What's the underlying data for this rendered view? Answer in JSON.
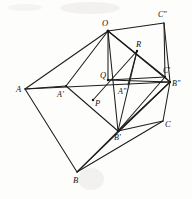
{
  "figure": {
    "width": 192,
    "height": 199,
    "background_color": "#fdfdfc",
    "stroke_color": "#1c1c1c"
  },
  "points": [
    {
      "id": "A",
      "label": "A",
      "x": 25,
      "y": 89,
      "label_x": 16,
      "label_y": 85
    },
    {
      "id": "Aprime",
      "label": "A'",
      "x": 66,
      "y": 86,
      "label_x": 57,
      "label_y": 91
    },
    {
      "id": "Adbl",
      "label": "A\"",
      "x": 128,
      "y": 85,
      "label_x": 118,
      "label_y": 88
    },
    {
      "id": "O",
      "label": "O",
      "x": 108,
      "y": 31,
      "label_x": 102,
      "label_y": 19
    },
    {
      "id": "Q",
      "label": "Q",
      "x": 108,
      "y": 80,
      "label_x": 100,
      "label_y": 71
    },
    {
      "id": "P",
      "label": "P",
      "x": 93,
      "y": 100,
      "label_x": 95,
      "label_y": 99
    },
    {
      "id": "R",
      "label": "R",
      "x": 137,
      "y": 51,
      "label_x": 136,
      "label_y": 40
    },
    {
      "id": "B",
      "label": "B",
      "x": 77,
      "y": 172,
      "label_x": 73,
      "label_y": 176
    },
    {
      "id": "Bprime",
      "label": "B'",
      "x": 118,
      "y": 131,
      "label_x": 114,
      "label_y": 134
    },
    {
      "id": "Bdbl",
      "label": "B\"",
      "x": 170,
      "y": 82,
      "label_x": 172,
      "label_y": 80
    },
    {
      "id": "C",
      "label": "C",
      "x": 163,
      "y": 121,
      "label_x": 165,
      "label_y": 120
    },
    {
      "id": "Cprime",
      "label": "C'",
      "x": 165,
      "y": 77,
      "label_x": 163,
      "label_y": 67
    },
    {
      "id": "Cdbl",
      "label": "C\"",
      "x": 164,
      "y": 23,
      "label_x": 158,
      "label_y": 11
    }
  ],
  "segments": [
    {
      "name": "A-O",
      "x1": 25,
      "y1": 89,
      "x2": 108,
      "y2": 31
    },
    {
      "name": "A-Aprime",
      "x1": 25,
      "y1": 89,
      "x2": 66,
      "y2": 86
    },
    {
      "name": "A-Bdbl",
      "x1": 25,
      "y1": 89,
      "x2": 170,
      "y2": 82
    },
    {
      "name": "A-B",
      "x1": 25,
      "y1": 89,
      "x2": 77,
      "y2": 172
    },
    {
      "name": "Aprime-O",
      "x1": 66,
      "y1": 86,
      "x2": 108,
      "y2": 31
    },
    {
      "name": "Aprime-Bprime",
      "x1": 66,
      "y1": 86,
      "x2": 118,
      "y2": 131
    },
    {
      "name": "O-Q",
      "x1": 108,
      "y1": 31,
      "x2": 108,
      "y2": 80
    },
    {
      "name": "O-Cdbl",
      "x1": 108,
      "y1": 31,
      "x2": 164,
      "y2": 23
    },
    {
      "name": "O-Cprime",
      "x1": 108,
      "y1": 31,
      "x2": 165,
      "y2": 77
    },
    {
      "name": "O-Bdbl",
      "x1": 108,
      "y1": 31,
      "x2": 170,
      "y2": 82
    },
    {
      "name": "O-Bprime",
      "x1": 108,
      "y1": 31,
      "x2": 118,
      "y2": 131
    },
    {
      "name": "Q-Bdbl",
      "x1": 108,
      "y1": 80,
      "x2": 170,
      "y2": 82
    },
    {
      "name": "Q-Cprime",
      "x1": 108,
      "y1": 80,
      "x2": 165,
      "y2": 77
    },
    {
      "name": "Cdbl-Cprime",
      "x1": 164,
      "y1": 23,
      "x2": 165,
      "y2": 77
    },
    {
      "name": "Cdbl-Bdbl",
      "x1": 164,
      "y1": 23,
      "x2": 170,
      "y2": 82
    },
    {
      "name": "Cprime-Bdbl",
      "x1": 165,
      "y1": 77,
      "x2": 170,
      "y2": 82
    },
    {
      "name": "Bdbl-C",
      "x1": 170,
      "y1": 82,
      "x2": 163,
      "y2": 121
    },
    {
      "name": "Bdbl-Bprime",
      "x1": 170,
      "y1": 82,
      "x2": 118,
      "y2": 131
    },
    {
      "name": "Cprime-Bprime",
      "x1": 165,
      "y1": 77,
      "x2": 118,
      "y2": 131
    },
    {
      "name": "C-Bprime",
      "x1": 163,
      "y1": 121,
      "x2": 118,
      "y2": 131
    },
    {
      "name": "C-B",
      "x1": 163,
      "y1": 121,
      "x2": 77,
      "y2": 172
    },
    {
      "name": "B-Bprime",
      "x1": 77,
      "y1": 172,
      "x2": 118,
      "y2": 131
    },
    {
      "name": "B-Bdbl",
      "x1": 77,
      "y1": 172,
      "x2": 170,
      "y2": 82
    },
    {
      "name": "P-R",
      "x1": 93,
      "y1": 100,
      "x2": 137,
      "y2": 51
    },
    {
      "name": "R-Bprime",
      "x1": 137,
      "y1": 51,
      "x2": 118,
      "y2": 131
    },
    {
      "name": "R-Adbl",
      "x1": 137,
      "y1": 51,
      "x2": 128,
      "y2": 85
    }
  ],
  "vertex_dots": [
    {
      "name": "dot-O",
      "x": 108,
      "y": 31,
      "r": 1.5
    },
    {
      "name": "dot-Q",
      "x": 108,
      "y": 80,
      "r": 1.2
    },
    {
      "name": "dot-P",
      "x": 93,
      "y": 100,
      "r": 1.2
    },
    {
      "name": "dot-R",
      "x": 137,
      "y": 51,
      "r": 1.2
    },
    {
      "name": "dot-Aprime",
      "x": 66,
      "y": 86,
      "r": 1.1
    },
    {
      "name": "dot-Bprime",
      "x": 118,
      "y": 131,
      "r": 1.1
    },
    {
      "name": "dot-Cprime",
      "x": 165,
      "y": 77,
      "r": 1.1
    },
    {
      "name": "dot-Bdbl",
      "x": 170,
      "y": 82,
      "r": 1.1
    }
  ]
}
